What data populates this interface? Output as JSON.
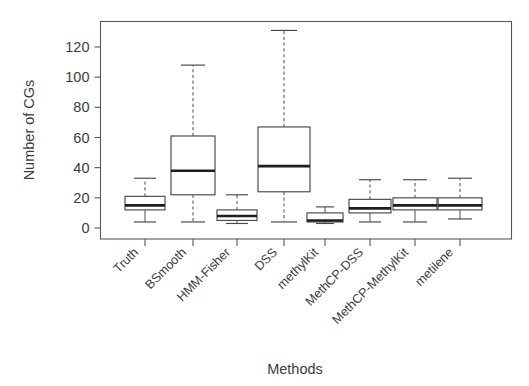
{
  "chart_data": {
    "type": "box",
    "title": "",
    "xlabel": "Methods",
    "ylabel": "Number of CGs",
    "ylim": [
      0,
      135
    ],
    "yticks": [
      0,
      20,
      40,
      60,
      80,
      100,
      120
    ],
    "ytick_labels": [
      "0",
      "20",
      "40",
      "60",
      "80",
      "100",
      "120"
    ],
    "grid": false,
    "legend": "none",
    "categories": [
      "Truth",
      "BSmooth",
      "HMM-Fisher",
      "DSS",
      "methylKit",
      "MethCP-DSS",
      "MethCP-MethylKit",
      "metilene"
    ],
    "boxes": [
      {
        "name": "Truth",
        "whisker_low": 4,
        "q1": 12,
        "median": 15,
        "q3": 21,
        "whisker_high": 33
      },
      {
        "name": "BSmooth",
        "whisker_low": 4,
        "q1": 22,
        "median": 38,
        "q3": 61,
        "whisker_high": 108
      },
      {
        "name": "HMM-Fisher",
        "whisker_low": 3,
        "q1": 5,
        "median": 8,
        "q3": 12,
        "whisker_high": 22
      },
      {
        "name": "DSS",
        "whisker_low": 4,
        "q1": 24,
        "median": 41,
        "q3": 67,
        "whisker_high": 131
      },
      {
        "name": "methylKit",
        "whisker_low": 3,
        "q1": 4,
        "median": 5,
        "q3": 10,
        "whisker_high": 14
      },
      {
        "name": "MethCP-DSS",
        "whisker_low": 4,
        "q1": 10,
        "median": 13,
        "q3": 19,
        "whisker_high": 32
      },
      {
        "name": "MethCP-MethylKit",
        "whisker_low": 4,
        "q1": 12,
        "median": 15,
        "q3": 20,
        "whisker_high": 32
      },
      {
        "name": "metilene",
        "whisker_low": 6,
        "q1": 12,
        "median": 15,
        "q3": 20,
        "whisker_high": 33
      }
    ]
  },
  "axes": {
    "y_title": "Number of CGs",
    "x_title": "Methods"
  }
}
